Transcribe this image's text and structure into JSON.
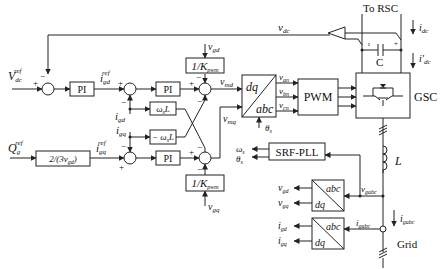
{
  "inputs": {
    "vdc_ref": "V",
    "vdc_ref_sub": "dc",
    "vdc_ref_sup": "ref",
    "qg_ref": "Q",
    "qg_ref_sub": "g",
    "qg_ref_sup": "ref"
  },
  "blocks": {
    "pi_dc": "PI",
    "pi_d": "PI",
    "pi_q": "PI",
    "q_gain": "2/(3v",
    "q_gain_sub": "gd",
    "q_gain_close": ")",
    "wl_pos": "ω",
    "wl_pos_sub": "s",
    "wl_pos_L": "L",
    "wl_neg": "− ω",
    "wl_neg_sub": "s",
    "wl_neg_L": "L",
    "kpwm_top": "1/K",
    "kpwm_top_sub": "pwm",
    "kpwm_bot": "1/K",
    "kpwm_bot_sub": "pwm",
    "dq_abc_top": "dq",
    "dq_abc_bot": "abc",
    "pwm": "PWM",
    "gsc": "GSC",
    "pll": "SRF-PLL",
    "abc_dq_v_top": "abc",
    "abc_dq_v_bot": "dq",
    "abc_dq_i_top": "abc",
    "abc_dq_i_bot": "dq",
    "capacitor": "C",
    "inductor": "L"
  },
  "signals": {
    "vdc": "v",
    "vdc_sub": "dc",
    "igd_ref": "i",
    "igd_ref_sub": "gd",
    "igd_ref_sup": "ref",
    "igq_ref": "i",
    "igq_ref_sub": "gq",
    "igq_ref_sup": "ref",
    "igd": "i",
    "igd_sub": "gd",
    "igq": "i",
    "igq_sub": "gq",
    "vgd": "v",
    "vgd_sub": "gd",
    "vgq": "v",
    "vgq_sub": "gq",
    "vmd": "v",
    "vmd_sub": "md",
    "vmq": "v",
    "vmq_sub": "mq",
    "van": "v",
    "van_sub": "an",
    "vbn": "v",
    "vbn_sub": "bn",
    "vcn": "v",
    "vcn_sub": "cn",
    "theta": "θ",
    "theta_sub": "s",
    "omega": "ω",
    "omega_sub": "s",
    "idc": "i",
    "idc_sub": "dc",
    "idc_prime": "i'",
    "idc_prime_sub": "dc",
    "vgabc": "v",
    "vgabc_sub": "gabc",
    "igabc": "i",
    "igabc_sub": "gabc",
    "igabc2": "i",
    "igabc2_sub": "gabc",
    "out_vgd": "v",
    "out_vgd_sub": "gd",
    "out_vgq": "v",
    "out_vgq_sub": "gq",
    "out_igd": "i",
    "out_igd_sub": "gd",
    "out_igq": "i",
    "out_igq_sub": "gq"
  },
  "labels": {
    "to_rsc": "To RSC",
    "grid": "Grid",
    "plus": "+",
    "minus": "−"
  }
}
